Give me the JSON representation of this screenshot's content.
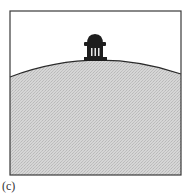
{
  "figure": {
    "caption": "(c)",
    "frame_color": "#3a3a3a",
    "sky_color": "#ffffff",
    "hill_fill": "#cfcfcf",
    "hill_stroke": "#2a2a2a",
    "building_color": "#1e1e1e",
    "elements": [
      "frame",
      "hill",
      "domed-building"
    ]
  }
}
